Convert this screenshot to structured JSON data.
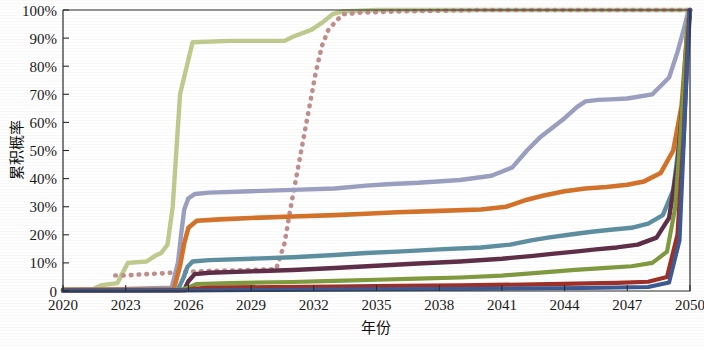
{
  "chart_data": {
    "type": "line",
    "title": "",
    "xlabel": "年份",
    "ylabel": "累积概率",
    "xlim": [
      2020,
      2050
    ],
    "ylim": [
      0,
      1
    ],
    "grid": false,
    "legend": "none",
    "xticks": [
      "2020",
      "2023",
      "2026",
      "2029",
      "2032",
      "2035",
      "2038",
      "2041",
      "2044",
      "2047",
      "2050"
    ],
    "xtick_values": [
      2020,
      2023,
      2026,
      2029,
      2032,
      2035,
      2038,
      2041,
      2044,
      2047,
      2050
    ],
    "yticks": [
      "0",
      "10%",
      "20%",
      "30%",
      "40%",
      "50%",
      "60%",
      "70%",
      "80%",
      "90%",
      "100%"
    ],
    "ytick_values": [
      0,
      0.1,
      0.2,
      0.3,
      0.4,
      0.5,
      0.6,
      0.7,
      0.8,
      0.9,
      1.0
    ],
    "series": [
      {
        "name": "series-light-green",
        "color": "#bfcb8e",
        "style": "solid",
        "width": 4.4,
        "x": [
          2020,
          2021.4,
          2021.8,
          2022.6,
          2023.1,
          2024.0,
          2024.4,
          2024.7,
          2025.0,
          2025.25,
          2025.6,
          2026.2,
          2028.0,
          2030.6,
          2031.0,
          2031.9,
          2032.4,
          2032.9,
          2033.4,
          2035.0,
          2040.0,
          2046.0,
          2049.4,
          2049.85,
          2050
        ],
        "values": [
          0.005,
          0.005,
          0.02,
          0.028,
          0.1,
          0.105,
          0.125,
          0.135,
          0.165,
          0.3,
          0.7,
          0.885,
          0.89,
          0.89,
          0.905,
          0.93,
          0.955,
          0.985,
          0.995,
          1.0,
          1.0,
          1.0,
          1.0,
          1.0,
          1.0
        ]
      },
      {
        "name": "series-rose-dotted",
        "color": "#c08f8c",
        "style": "dotted",
        "width": 4.6,
        "x": [
          2022.5,
          2023.0,
          2023.5,
          2024.0,
          2024.6,
          2025.2,
          2025.9,
          2026.4,
          2027.2,
          2028.2,
          2029.2,
          2030.2,
          2030.6,
          2030.9,
          2031.2,
          2031.5,
          2031.8,
          2032.1,
          2032.4,
          2032.7,
          2033.0,
          2033.4,
          2034.2,
          2036.0,
          2040.0,
          2045.0,
          2049.5,
          2050
        ],
        "values": [
          0.055,
          0.055,
          0.058,
          0.06,
          0.062,
          0.065,
          0.068,
          0.07,
          0.072,
          0.073,
          0.075,
          0.078,
          0.17,
          0.3,
          0.42,
          0.54,
          0.66,
          0.78,
          0.875,
          0.93,
          0.955,
          0.985,
          0.99,
          0.995,
          1.0,
          1.0,
          1.0,
          1.0
        ]
      },
      {
        "name": "series-blue-gray",
        "color": "#9ba0c0",
        "style": "solid",
        "width": 4.4,
        "x": [
          2020,
          2023.0,
          2025.2,
          2025.5,
          2025.65,
          2025.8,
          2026.0,
          2026.3,
          2027.0,
          2029.0,
          2031.0,
          2033.0,
          2034.5,
          2035.5,
          2037.0,
          2039.0,
          2040.5,
          2041.5,
          2042.2,
          2042.8,
          2043.4,
          2044.0,
          2044.6,
          2045.0,
          2045.6,
          2046.2,
          2047.0,
          2048.2,
          2049.0,
          2049.4,
          2049.7,
          2049.9,
          2050
        ],
        "values": [
          0.005,
          0.007,
          0.012,
          0.1,
          0.2,
          0.29,
          0.33,
          0.345,
          0.35,
          0.355,
          0.36,
          0.365,
          0.375,
          0.38,
          0.385,
          0.395,
          0.41,
          0.44,
          0.5,
          0.545,
          0.58,
          0.615,
          0.655,
          0.675,
          0.68,
          0.682,
          0.685,
          0.7,
          0.76,
          0.85,
          0.93,
          0.99,
          1.0
        ]
      },
      {
        "name": "series-orange",
        "color": "#d4722a",
        "style": "solid",
        "width": 4.6,
        "x": [
          2020,
          2024.0,
          2025.3,
          2025.6,
          2025.8,
          2026.0,
          2026.4,
          2027.5,
          2029.0,
          2031.0,
          2033.0,
          2034.5,
          2036.0,
          2038.0,
          2040.0,
          2041.2,
          2042.2,
          2043.0,
          2044.0,
          2045.0,
          2046.0,
          2047.0,
          2047.8,
          2048.6,
          2049.2,
          2049.6,
          2049.85,
          2050
        ],
        "values": [
          0.004,
          0.005,
          0.006,
          0.09,
          0.17,
          0.225,
          0.25,
          0.255,
          0.26,
          0.265,
          0.27,
          0.275,
          0.28,
          0.285,
          0.29,
          0.3,
          0.325,
          0.34,
          0.355,
          0.365,
          0.37,
          0.378,
          0.39,
          0.42,
          0.5,
          0.66,
          0.9,
          1.0
        ]
      },
      {
        "name": "series-teal",
        "color": "#5e8fa0",
        "style": "solid",
        "width": 4.4,
        "x": [
          2020,
          2024.5,
          2025.5,
          2025.75,
          2025.95,
          2026.2,
          2027.0,
          2029.0,
          2031.0,
          2033.0,
          2034.5,
          2036.0,
          2038.0,
          2040.0,
          2041.4,
          2042.4,
          2043.2,
          2044.2,
          2045.2,
          2046.2,
          2047.2,
          2048.0,
          2048.7,
          2049.2,
          2049.6,
          2049.85,
          2050
        ],
        "values": [
          0.003,
          0.004,
          0.005,
          0.045,
          0.085,
          0.105,
          0.11,
          0.115,
          0.12,
          0.128,
          0.135,
          0.14,
          0.148,
          0.155,
          0.165,
          0.18,
          0.19,
          0.2,
          0.21,
          0.218,
          0.225,
          0.24,
          0.27,
          0.36,
          0.6,
          0.9,
          1.0
        ]
      },
      {
        "name": "series-dark-purple",
        "color": "#5f2f4a",
        "style": "solid",
        "width": 4.4,
        "x": [
          2020,
          2025.0,
          2025.8,
          2026.0,
          2026.3,
          2027.0,
          2029.0,
          2031.0,
          2033.0,
          2035.0,
          2037.0,
          2039.0,
          2041.0,
          2042.5,
          2043.5,
          2044.5,
          2045.5,
          2046.5,
          2047.5,
          2048.4,
          2049.0,
          2049.4,
          2049.7,
          2049.9,
          2050
        ],
        "values": [
          0.002,
          0.003,
          0.004,
          0.035,
          0.06,
          0.065,
          0.07,
          0.075,
          0.082,
          0.09,
          0.098,
          0.105,
          0.115,
          0.125,
          0.133,
          0.14,
          0.148,
          0.155,
          0.165,
          0.19,
          0.26,
          0.45,
          0.72,
          0.94,
          1.0
        ]
      },
      {
        "name": "series-olive",
        "color": "#7f9a3f",
        "style": "solid",
        "width": 4.2,
        "x": [
          2020,
          2025.5,
          2026.0,
          2026.4,
          2028.0,
          2031.0,
          2033.0,
          2035.0,
          2037.0,
          2039.0,
          2041.0,
          2043.0,
          2044.5,
          2046.0,
          2047.2,
          2048.2,
          2048.9,
          2049.3,
          2049.6,
          2049.85,
          2050
        ],
        "values": [
          0.002,
          0.002,
          0.012,
          0.025,
          0.028,
          0.032,
          0.036,
          0.04,
          0.044,
          0.048,
          0.055,
          0.066,
          0.075,
          0.082,
          0.088,
          0.1,
          0.14,
          0.3,
          0.62,
          0.92,
          1.0
        ]
      },
      {
        "name": "series-dark-red",
        "color": "#9e3028",
        "style": "solid",
        "width": 4.2,
        "x": [
          2020,
          2025.8,
          2026.2,
          2027.0,
          2030.0,
          2033.0,
          2036.0,
          2039.0,
          2042.0,
          2044.5,
          2046.5,
          2048.0,
          2048.9,
          2049.4,
          2049.7,
          2049.9,
          2050
        ],
        "values": [
          0.001,
          0.002,
          0.008,
          0.012,
          0.014,
          0.016,
          0.018,
          0.02,
          0.023,
          0.026,
          0.029,
          0.033,
          0.05,
          0.2,
          0.55,
          0.9,
          1.0
        ]
      },
      {
        "name": "series-navy",
        "color": "#3d5a93",
        "style": "solid",
        "width": 4.0,
        "x": [
          2020,
          2026.0,
          2030.0,
          2035.0,
          2040.0,
          2045.0,
          2048.0,
          2049.0,
          2049.5,
          2049.8,
          2050
        ],
        "values": [
          0.001,
          0.002,
          0.004,
          0.006,
          0.008,
          0.011,
          0.014,
          0.03,
          0.18,
          0.7,
          1.0
        ]
      }
    ]
  },
  "axes": {
    "y_title": "累积概率",
    "x_title": "年份"
  }
}
